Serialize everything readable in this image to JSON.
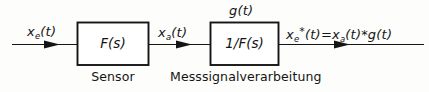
{
  "diagram": {
    "line_color": "#151515",
    "background": "#fdfdfc",
    "signals": {
      "input_label": "x",
      "input_sub": "e",
      "input_arg": "(t)",
      "middle_label": "x",
      "middle_sub": "a",
      "middle_arg": "(t)",
      "impulse_label": "g(t)",
      "output_expr_lhs": "x",
      "output_expr_lhs_sub": "e",
      "output_expr_lhs_star": "*",
      "output_expr_lhs_arg": "(t)",
      "output_expr_eq": "=",
      "output_expr_rhs_1": "x",
      "output_expr_rhs_1_sub": "a",
      "output_expr_rhs_1_arg": "(t)",
      "output_expr_conv": "*",
      "output_expr_rhs_2": "g",
      "output_expr_rhs_2_arg": "(t)"
    },
    "blocks": [
      {
        "id": "sensor",
        "transfer_function": "F(s)",
        "caption": "Sensor"
      },
      {
        "id": "signal-processing",
        "transfer_function": "1/F(s)",
        "caption": "Messsignalverarbeitung"
      }
    ]
  }
}
